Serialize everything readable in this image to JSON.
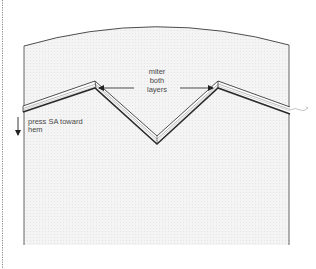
{
  "diagram": {
    "type": "sewing-instruction-illustration",
    "labels": {
      "miter_line1": "miter",
      "miter_line2": "both",
      "miter_line3": "layers",
      "press_line1": "press SA toward",
      "press_line2": "hem"
    },
    "colors": {
      "outline": "#3a3a3a",
      "fabric_fill": "#f3f3f3",
      "fabric_texture": "#e6e6e6",
      "band_highlight": "#ffffff",
      "text": "#4a4a4a",
      "dotted_border": "#6a6a6a"
    },
    "arrows": [
      {
        "name": "miter-arrow-left",
        "from": [
          134,
          88
        ],
        "to": [
          98,
          88
        ]
      },
      {
        "name": "miter-arrow-right",
        "from": [
          180,
          88
        ],
        "to": [
          214,
          88
        ]
      },
      {
        "name": "press-direction-arrow",
        "from": [
          18,
          118
        ],
        "to": [
          18,
          136
        ]
      }
    ]
  }
}
